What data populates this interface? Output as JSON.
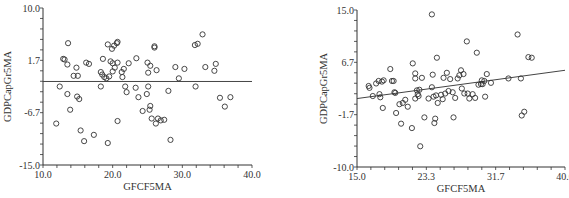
{
  "chart_data": [
    {
      "type": "scatter",
      "title": "",
      "xlabel": "GFCF5MA",
      "ylabel": "GDPCapGr5MA",
      "xlim": [
        10.0,
        40.0
      ],
      "ylim": [
        -15.0,
        10.0
      ],
      "xticks": [
        "10.0",
        "20.0",
        "30.0",
        "40.0"
      ],
      "yticks": [
        "10.0",
        "1.7",
        "-6.7",
        "-15.0"
      ],
      "grid": false,
      "legend": null,
      "marker": "open-circle",
      "fit_line": {
        "x": [
          10.0,
          40.0
        ],
        "y": [
          -1.7,
          -1.7
        ]
      },
      "points": [
        [
          13.6,
          4.4
        ],
        [
          12.9,
          1.9
        ],
        [
          13.1,
          1.8
        ],
        [
          13.5,
          1.0
        ],
        [
          14.8,
          0.5
        ],
        [
          14.4,
          -0.8
        ],
        [
          15.0,
          -0.8
        ],
        [
          12.4,
          -2.5
        ],
        [
          13.5,
          -3.7
        ],
        [
          14.9,
          -4.1
        ],
        [
          15.2,
          -4.5
        ],
        [
          13.9,
          -6.2
        ],
        [
          11.9,
          -8.4
        ],
        [
          15.4,
          -9.5
        ],
        [
          15.9,
          -11.2
        ],
        [
          17.3,
          -10.2
        ],
        [
          19.3,
          -11.5
        ],
        [
          16.2,
          1.3
        ],
        [
          16.6,
          1.1
        ],
        [
          18.6,
          1.9
        ],
        [
          18.3,
          -0.2
        ],
        [
          18.5,
          -0.6
        ],
        [
          18.8,
          -1.0
        ],
        [
          19.1,
          -1.2
        ],
        [
          19.5,
          -0.9
        ],
        [
          18.3,
          -2.5
        ],
        [
          19.7,
          1.5
        ],
        [
          20.0,
          1.2
        ],
        [
          20.3,
          0.5
        ],
        [
          20.0,
          -0.1
        ],
        [
          19.3,
          4.2
        ],
        [
          19.9,
          3.5
        ],
        [
          20.2,
          4.0
        ],
        [
          20.6,
          4.4
        ],
        [
          20.7,
          4.6
        ],
        [
          20.7,
          1.3
        ],
        [
          21.3,
          -0.2
        ],
        [
          21.6,
          0.3
        ],
        [
          21.4,
          -1.0
        ],
        [
          21.8,
          -2.5
        ],
        [
          22.0,
          -3.4
        ],
        [
          22.3,
          1.2
        ],
        [
          20.7,
          -8.0
        ],
        [
          23.4,
          2.0
        ],
        [
          23.3,
          -2.7
        ],
        [
          23.7,
          -4.2
        ],
        [
          24.3,
          -6.4
        ],
        [
          24.9,
          -3.7
        ],
        [
          25.0,
          1.3
        ],
        [
          25.1,
          -0.3
        ],
        [
          25.1,
          -2.5
        ],
        [
          25.3,
          -6.2
        ],
        [
          25.4,
          -5.6
        ],
        [
          25.4,
          0.8
        ],
        [
          25.6,
          -7.6
        ],
        [
          26.0,
          3.9
        ],
        [
          26.0,
          3.7
        ],
        [
          26.3,
          0.1
        ],
        [
          26.2,
          -8.4
        ],
        [
          26.5,
          -7.6
        ],
        [
          26.9,
          -7.9
        ],
        [
          27.4,
          -7.8
        ],
        [
          28.0,
          -3.2
        ],
        [
          28.3,
          -11.0
        ],
        [
          29.0,
          0.6
        ],
        [
          29.5,
          -1.2
        ],
        [
          30.3,
          0.3
        ],
        [
          31.8,
          4.1
        ],
        [
          32.2,
          4.3
        ],
        [
          32.9,
          5.8
        ],
        [
          31.9,
          -2.5
        ],
        [
          33.3,
          0.6
        ],
        [
          34.6,
          0.0
        ],
        [
          34.8,
          1.1
        ],
        [
          35.4,
          -4.3
        ],
        [
          36.1,
          -5.7
        ],
        [
          36.9,
          -4.2
        ]
      ]
    },
    {
      "type": "scatter",
      "title": "",
      "xlabel": "GFCF5MA",
      "ylabel": "GDPCapGr5MA",
      "xlim": [
        15.0,
        40.0
      ],
      "ylim": [
        -10.0,
        15.0
      ],
      "xticks": [
        "15.0",
        "23.3",
        "31.7",
        "40.0"
      ],
      "yticks": [
        "15.0",
        "6.7",
        "-1.7",
        "-10.0"
      ],
      "grid": false,
      "legend": null,
      "marker": "open-circle",
      "fit_line": {
        "x": [
          15.0,
          40.0
        ],
        "y": [
          0.9,
          5.4
        ]
      },
      "points": [
        [
          16.4,
          2.9
        ],
        [
          16.5,
          2.6
        ],
        [
          16.9,
          1.3
        ],
        [
          17.3,
          3.3
        ],
        [
          17.6,
          3.7
        ],
        [
          17.7,
          1.6
        ],
        [
          17.8,
          1.1
        ],
        [
          18.0,
          3.6
        ],
        [
          18.1,
          -0.6
        ],
        [
          18.2,
          3.8
        ],
        [
          19.0,
          5.6
        ],
        [
          19.2,
          3.7
        ],
        [
          19.4,
          3.7
        ],
        [
          19.5,
          1.9
        ],
        [
          19.6,
          1.8
        ],
        [
          19.7,
          -1.4
        ],
        [
          20.1,
          0.0
        ],
        [
          20.3,
          -3.1
        ],
        [
          20.5,
          0.2
        ],
        [
          20.8,
          0.7
        ],
        [
          21.1,
          -0.4
        ],
        [
          21.6,
          -3.8
        ],
        [
          21.7,
          6.5
        ],
        [
          22.0,
          4.9
        ],
        [
          22.0,
          4.1
        ],
        [
          22.0,
          0.9
        ],
        [
          22.2,
          2.2
        ],
        [
          22.3,
          1.6
        ],
        [
          22.4,
          1.3
        ],
        [
          22.5,
          2.3
        ],
        [
          22.6,
          -6.7
        ],
        [
          22.8,
          4.2
        ],
        [
          23.1,
          -2.1
        ],
        [
          23.6,
          0.9
        ],
        [
          24.0,
          14.3
        ],
        [
          24.0,
          2.7
        ],
        [
          24.1,
          4.7
        ],
        [
          24.2,
          1.2
        ],
        [
          24.3,
          -3.0
        ],
        [
          24.4,
          -2.3
        ],
        [
          24.5,
          1.4
        ],
        [
          24.6,
          7.4
        ],
        [
          24.7,
          0.2
        ],
        [
          25.1,
          1.5
        ],
        [
          25.3,
          0.8
        ],
        [
          25.4,
          4.2
        ],
        [
          25.6,
          1.7
        ],
        [
          25.8,
          5.0
        ],
        [
          26.0,
          2.1
        ],
        [
          26.2,
          4.0
        ],
        [
          26.5,
          1.9
        ],
        [
          26.6,
          -2.1
        ],
        [
          26.8,
          1.0
        ],
        [
          27.1,
          4.1
        ],
        [
          27.3,
          4.6
        ],
        [
          27.5,
          5.4
        ],
        [
          27.6,
          2.5
        ],
        [
          27.8,
          4.8
        ],
        [
          27.9,
          1.7
        ],
        [
          28.2,
          10.0
        ],
        [
          28.3,
          1.7
        ],
        [
          28.5,
          0.9
        ],
        [
          28.9,
          1.6
        ],
        [
          29.2,
          1.0
        ],
        [
          29.4,
          8.2
        ],
        [
          29.6,
          3.1
        ],
        [
          29.9,
          3.2
        ],
        [
          30.0,
          3.8
        ],
        [
          30.1,
          3.2
        ],
        [
          30.3,
          3.7
        ],
        [
          30.4,
          1.2
        ],
        [
          30.6,
          4.8
        ],
        [
          31.1,
          3.4
        ],
        [
          33.2,
          4.1
        ],
        [
          34.3,
          11.1
        ],
        [
          34.7,
          4.1
        ],
        [
          34.8,
          -1.8
        ],
        [
          35.1,
          -1.2
        ],
        [
          35.6,
          7.5
        ],
        [
          36.0,
          7.4
        ]
      ]
    }
  ],
  "footnote": "Note: Each ..."
}
